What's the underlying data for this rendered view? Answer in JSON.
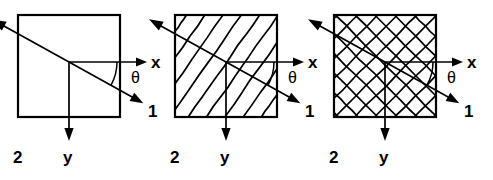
{
  "figure": {
    "width": 493,
    "height": 180,
    "background_color": "#ffffff",
    "line_color": "#000000"
  },
  "labels": {
    "x_axis": "x",
    "y_axis": "y",
    "axis_1": "1",
    "axis_2": "2",
    "theta": "θ"
  },
  "panels": [
    {
      "id": "panel-unidirectional",
      "pattern": "none",
      "pattern_name": "plain-unreinforced",
      "square": {
        "x": 18,
        "y": 15,
        "size": 102
      },
      "origin": {
        "x": 69,
        "y": 62
      },
      "axes": {
        "x": {
          "label": "x",
          "angle_deg": 0,
          "length": 78,
          "label_pos": {
            "x": 151,
            "y": 68
          }
        },
        "y": {
          "label": "y",
          "angle_deg": 90,
          "length": 79,
          "label_pos": {
            "x": 63,
            "y": 163
          }
        },
        "axis_1": {
          "label": "1",
          "angle_deg": 29,
          "length": 85,
          "label_pos": {
            "x": 148,
            "y": 117
          }
        },
        "axis_2": {
          "label": "2",
          "angle_deg": 209,
          "length": 88,
          "label_pos": {
            "x": 13,
            "y": 163
          }
        }
      },
      "theta": {
        "label": "θ",
        "value_deg": 29,
        "label_pos": {
          "x": 131,
          "y": 83
        }
      }
    },
    {
      "id": "panel-diagonal-hatch",
      "pattern": "diagonal",
      "pattern_name": "unidirectional-fiber-hatch",
      "hatch": {
        "angle_deg": -55,
        "spacing": 15,
        "stroke_width": 1.7
      },
      "square": {
        "x": 175,
        "y": 15,
        "size": 102
      },
      "origin": {
        "x": 226,
        "y": 62
      },
      "axes": {
        "x": {
          "label": "x",
          "angle_deg": 0,
          "length": 78,
          "label_pos": {
            "x": 308,
            "y": 68
          }
        },
        "y": {
          "label": "y",
          "angle_deg": 90,
          "length": 79,
          "label_pos": {
            "x": 220,
            "y": 163
          }
        },
        "axis_1": {
          "label": "1",
          "angle_deg": 29,
          "length": 85,
          "label_pos": {
            "x": 305,
            "y": 117
          }
        },
        "axis_2": {
          "label": "2",
          "angle_deg": 209,
          "length": 88,
          "label_pos": {
            "x": 170,
            "y": 163
          }
        }
      },
      "theta": {
        "label": "θ",
        "value_deg": 29,
        "label_pos": {
          "x": 288,
          "y": 83
        }
      }
    },
    {
      "id": "panel-crosshatch",
      "pattern": "crosshatch",
      "pattern_name": "woven-fabric-crosshatch",
      "hatch": {
        "angle_deg": -45,
        "angle_deg_2": 45,
        "spacing": 14,
        "stroke_width": 1.7
      },
      "square": {
        "x": 334,
        "y": 15,
        "size": 102
      },
      "origin": {
        "x": 385,
        "y": 62
      },
      "axes": {
        "x": {
          "label": "x",
          "angle_deg": 0,
          "length": 78,
          "label_pos": {
            "x": 467,
            "y": 68
          }
        },
        "y": {
          "label": "y",
          "angle_deg": 90,
          "length": 79,
          "label_pos": {
            "x": 379,
            "y": 163
          }
        },
        "axis_1": {
          "label": "1",
          "angle_deg": 29,
          "length": 85,
          "label_pos": {
            "x": 464,
            "y": 117
          }
        },
        "axis_2": {
          "label": "2",
          "angle_deg": 209,
          "length": 88,
          "label_pos": {
            "x": 329,
            "y": 163
          }
        }
      },
      "theta": {
        "label": "θ",
        "value_deg": 29,
        "label_pos": {
          "x": 447,
          "y": 83
        }
      }
    }
  ]
}
